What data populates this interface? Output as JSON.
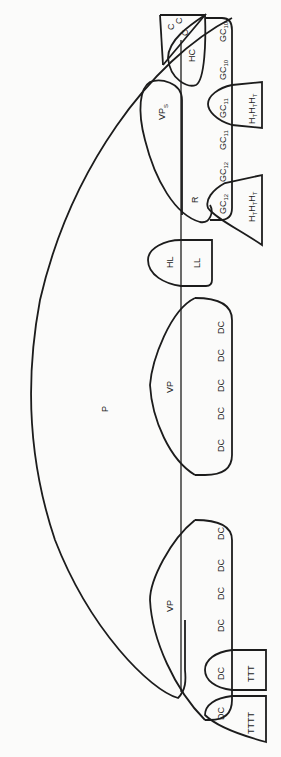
{
  "diagram": {
    "orientation": "rotated-90-ccw",
    "colors": {
      "stroke": "#1c1c1c",
      "background": "#fbfbfa"
    },
    "labels": {
      "P": "P",
      "VP_s": "VP",
      "VP_s_sub": "S",
      "R": "R",
      "HC": "HC",
      "C": [
        "C",
        "C",
        "C"
      ],
      "HL": "HL",
      "LL": "LL",
      "VP_middle": "VP",
      "VP_lower": "VP",
      "GC_base": "GC",
      "GC_column": [
        {
          "text": "GC",
          "sub": "10"
        },
        {
          "text": "GC",
          "sub": "10"
        },
        {
          "text": "GC",
          "sub": "11"
        },
        {
          "text": "GC",
          "sub": "11"
        },
        {
          "text": "GC",
          "sub": "12"
        },
        {
          "text": "GC",
          "sub": "12"
        }
      ],
      "H_T_group_top": "H",
      "H_T_sub": "T",
      "DC_middle": [
        "DC",
        "DC",
        "DC",
        "DC",
        "DC"
      ],
      "DC_lower": [
        "DC",
        "DC",
        "DC",
        "DC",
        "DC",
        "DC"
      ],
      "TTT": "TTT",
      "TTTT": "TTTT"
    }
  }
}
